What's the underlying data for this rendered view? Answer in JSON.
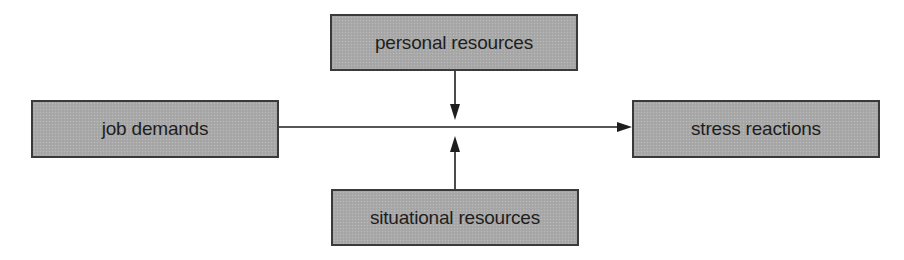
{
  "diagram": {
    "nodes": {
      "job_demands": "job demands",
      "personal_resources": "personal resources",
      "situational_resources": "situational resources",
      "stress_reactions": "stress reactions"
    },
    "edges": [
      {
        "from": "job demands",
        "to": "stress reactions",
        "type": "arrow"
      },
      {
        "from": "personal resources",
        "to": "job demands → stress reactions link",
        "type": "moderating-arrow"
      },
      {
        "from": "situational resources",
        "to": "job demands → stress reactions link",
        "type": "moderating-arrow"
      }
    ],
    "colors": {
      "box_fill": "#a9a9a9",
      "box_border": "#3a3a3a",
      "line": "#1e1e1e",
      "text": "#1e1e1e"
    }
  }
}
